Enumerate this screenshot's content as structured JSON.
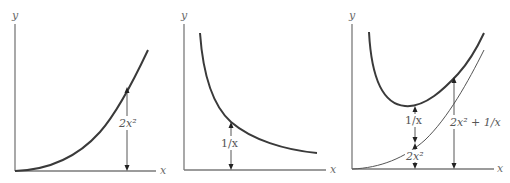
{
  "panels": [
    {
      "id": "panel-1",
      "axis_labels": {
        "x": "x",
        "y": "y"
      },
      "curves": [
        {
          "name": "2x^2",
          "weight": "thick"
        }
      ],
      "annotations": [
        {
          "label": "2x²",
          "measures": "height of curve above x-axis"
        }
      ]
    },
    {
      "id": "panel-2",
      "axis_labels": {
        "x": "x",
        "y": "y"
      },
      "curves": [
        {
          "name": "1/x",
          "weight": "thick"
        }
      ],
      "annotations": [
        {
          "label": "1/x",
          "measures": "height of curve above x-axis"
        }
      ]
    },
    {
      "id": "panel-3",
      "axis_labels": {
        "x": "x",
        "y": "y"
      },
      "curves": [
        {
          "name": "2x^2 + 1/x",
          "weight": "thick"
        },
        {
          "name": "2x^2",
          "weight": "thin"
        }
      ],
      "annotations": [
        {
          "label": "1/x",
          "measures": "gap between thick and thin curve"
        },
        {
          "label": "2x²",
          "measures": "height of thin curve above x-axis"
        },
        {
          "label": "2x² + 1/x",
          "measures": "height of thick curve above x-axis"
        }
      ]
    }
  ],
  "labels": {
    "p1_y": "y",
    "p1_x": "x",
    "p1_dim": "2x²",
    "p2_y": "y",
    "p2_x": "x",
    "p2_dim": "1/x",
    "p3_y": "y",
    "p3_x": "x",
    "p3_dim_a": "1/x",
    "p3_dim_b": "2x²",
    "p3_dim_c": "2x² + 1/x"
  }
}
